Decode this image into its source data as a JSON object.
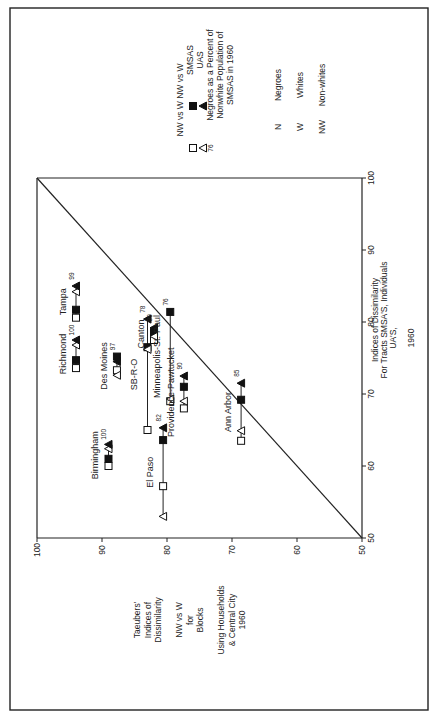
{
  "chart_data": {
    "type": "scatter",
    "orientation": "rotated-90-ccw",
    "xlabel": [
      "Taeubers'",
      "Indices of",
      "Dissimilarity",
      "",
      "NW vs W",
      "for",
      "Blocks",
      "",
      "Using Households",
      "& Central City",
      "1960"
    ],
    "ylabel": [
      "Indices of Dissimilarity",
      "For Tracts SMSA'S, Individuals",
      "UA'S,",
      "",
      "1960"
    ],
    "xlim": [
      50,
      100
    ],
    "ylim": [
      50,
      100
    ],
    "xticks": [
      100,
      90,
      80,
      70,
      60,
      50
    ],
    "yticks": [
      50,
      60,
      70,
      80,
      90,
      100
    ],
    "diagonal": true,
    "grid": false,
    "legend": {
      "header": [
        "NW vs W",
        "NW vs W"
      ],
      "rows": [
        {
          "open": "square",
          "filled": "square",
          "label": "SMSAS"
        },
        {
          "open": "triangle",
          "filled": "triangle",
          "label": "UAS"
        }
      ],
      "note_marker": "76",
      "note": [
        "Negroes as a Percent of",
        "Nonwhite Population of",
        "SMSAS in 1960"
      ],
      "abbreviations": [
        {
          "abbr": "N",
          "meaning": "Negroes"
        },
        {
          "abbr": "W",
          "meaning": "Whites"
        },
        {
          "abbr": "NW",
          "meaning": "Non-whites"
        }
      ]
    },
    "series_note": "open = NW vs W (SMSA □ / UA △); filled = N vs W (SMSA ■ / UA ▲)",
    "cities": [
      {
        "name": "Richmond",
        "taeuber": 94.0,
        "pct_negro": 100,
        "nw_smsa": 73.6,
        "n_smsa": 74.7,
        "nw_ua": 76.8,
        "n_ua": 77.5
      },
      {
        "name": "Tampa",
        "taeuber": 94.0,
        "pct_negro": 99,
        "nw_smsa": 80.6,
        "n_smsa": 81.7,
        "nw_ua": 84.2,
        "n_ua": 85.0
      },
      {
        "name": "Birmingham",
        "taeuber": 89.0,
        "pct_negro": 100,
        "nw_smsa": 60.0,
        "n_smsa": 61.0,
        "nw_ua": 62.4,
        "n_ua": 63.0
      },
      {
        "name": "Des Moines",
        "taeuber": 87.7,
        "pct_negro": 97,
        "nw_smsa": 73.3,
        "n_smsa": 75.2,
        "nw_ua": 72.6,
        "n_ua": 74.5
      },
      {
        "name": "SB-R-O",
        "taeuber": 83.0,
        "pct_negro": 78,
        "nw_smsa": 65.0,
        "n_smsa": 76.5,
        "nw_ua": 76.2,
        "n_ua": 80.4
      },
      {
        "name": "Canton",
        "taeuber": 82.0,
        "pct_negro": 99,
        "nw_smsa": 77.5,
        "n_smsa": 78.6,
        "nw_ua": 78.0,
        "n_ua": 79.2
      },
      {
        "name": "El Paso",
        "taeuber": 80.6,
        "pct_negro": 82,
        "nw_smsa": 57.2,
        "n_smsa": 63.6,
        "nw_ua": 53.0,
        "n_ua": 65.3
      },
      {
        "name": "Minneapolis-St.-Paul",
        "taeuber": 79.5,
        "pct_negro": 76,
        "nw_smsa": 69.0,
        "n_smsa": 81.4,
        "nw_ua": 69.3,
        "n_ua": null
      },
      {
        "name": "Providence-Pawtucket",
        "taeuber": 77.4,
        "pct_negro": 90,
        "nw_smsa": 68.0,
        "n_smsa": 71.0,
        "nw_ua": 69.0,
        "n_ua": 72.5
      },
      {
        "name": "Ann Arbor",
        "taeuber": 68.6,
        "pct_negro": 85,
        "nw_smsa": 63.5,
        "n_smsa": 69.2,
        "nw_ua": 64.9,
        "n_ua": 71.5
      }
    ]
  }
}
